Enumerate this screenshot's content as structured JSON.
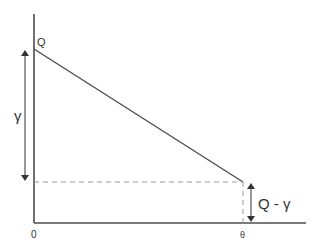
{
  "diagram": {
    "labels": {
      "top_point": "Q",
      "gamma": "γ",
      "difference": "Q - γ",
      "origin": "0",
      "theta": "θ"
    },
    "colors": {
      "line": "#4d4d4d",
      "dashed": "#999999",
      "text": "#333333"
    }
  }
}
